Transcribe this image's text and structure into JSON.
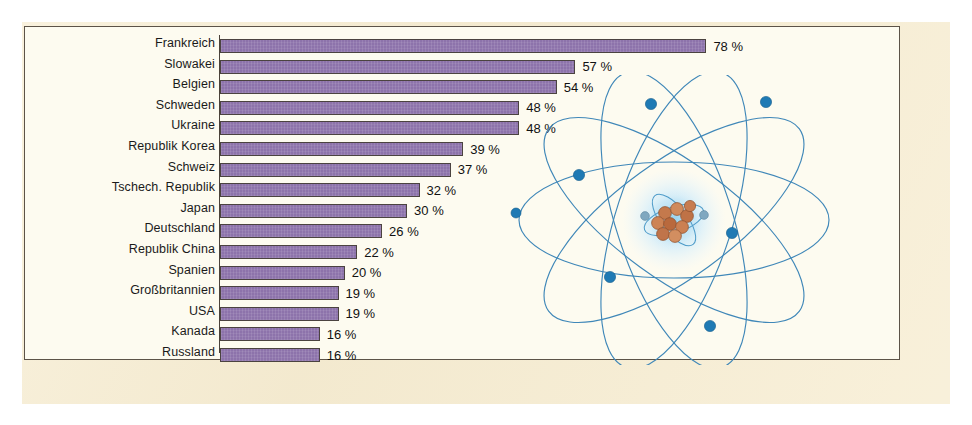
{
  "figure": {
    "background_color": "#f7edd2",
    "panel_color": "#fdfbf0",
    "bar_color": "#8d73ab",
    "bar_outline_color": "#4b4340",
    "axis_color": "#4a4239",
    "illustration_name": "atom-diagram",
    "illustration_orbit_color": "#3f87b8",
    "illustration_electron_color": "#1f7ab4",
    "illustration_nucleus_color": "#c87a4e"
  },
  "chart_data": {
    "type": "bar",
    "orientation": "horizontal",
    "title": "",
    "subtitle": "",
    "xlabel": "",
    "ylabel": "",
    "xlim": [
      0,
      85
    ],
    "grid": false,
    "legend": false,
    "value_suffix": " %",
    "categories": [
      "Frankreich",
      "Slowakei",
      "Belgien",
      "Schweden",
      "Ukraine",
      "Republik Korea",
      "Schweiz",
      "Tschech. Republik",
      "Japan",
      "Deutschland",
      "Republik China",
      "Spanien",
      "Großbritannien",
      "USA",
      "Kanada",
      "Russland"
    ],
    "values": [
      78,
      57,
      54,
      48,
      48,
      39,
      37,
      32,
      30,
      26,
      22,
      20,
      19,
      19,
      16,
      16
    ],
    "value_labels": [
      "78 %",
      "57 %",
      "54 %",
      "48 %",
      "48 %",
      "39 %",
      "37 %",
      "32 %",
      "30 %",
      "26 %",
      "22 %",
      "20 %",
      "19 %",
      "19 %",
      "16 %",
      "16 %"
    ]
  },
  "illustration": {
    "electron_count": 7,
    "orbit_count": 5,
    "nucleon_count": 9
  }
}
